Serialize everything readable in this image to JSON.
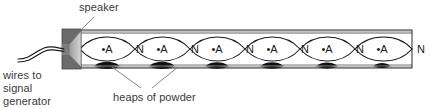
{
  "figure": {
    "background_color": "#ffffff"
  },
  "labels": {
    "speaker": "speaker",
    "wires_line1": "wires to",
    "wires_line2": "signal",
    "wires_line3": "generator",
    "heaps": "heaps of powder"
  },
  "diagram": {
    "tube": {
      "x": 80,
      "y": 30,
      "width": 332,
      "height": 38,
      "outline_color": "#2b2b2b",
      "wall_fill": "#b9b9b9",
      "interior_fill": "#ffffff"
    },
    "speaker": {
      "x": 62,
      "y": 29,
      "width": 19,
      "height": 40,
      "body_color": "#6b6b6b",
      "cone_color": "#c9c9c9",
      "outline_color": "#4a4a4a"
    },
    "wires": {
      "color": "#1a1a1a",
      "stroke": 1.2
    },
    "wave": {
      "color": "#1a1a1a",
      "stroke": 1.1,
      "axis_y": 49,
      "amplitude": 16,
      "loops": 6,
      "start_x": 80,
      "end_x": 412
    },
    "antinode_marker": "•A",
    "node_marker": "N",
    "antinodes": [
      {
        "label": "•A",
        "x": 107
      },
      {
        "label": "•A",
        "x": 162
      },
      {
        "label": "•A",
        "x": 217
      },
      {
        "label": "•A",
        "x": 272
      },
      {
        "label": "•A",
        "x": 327
      },
      {
        "label": "•A",
        "x": 382
      }
    ],
    "nodes": [
      {
        "label": "N",
        "x": 140
      },
      {
        "label": "N",
        "x": 195
      },
      {
        "label": "N",
        "x": 250
      },
      {
        "label": "N",
        "x": 305
      },
      {
        "label": "N",
        "x": 360
      },
      {
        "label": "N",
        "x": 420
      }
    ],
    "powder_heaps": [
      {
        "x": 107,
        "width": 26
      },
      {
        "x": 162,
        "width": 26
      },
      {
        "x": 217,
        "width": 26
      },
      {
        "x": 272,
        "width": 26
      },
      {
        "x": 327,
        "width": 26
      },
      {
        "x": 382,
        "width": 22
      }
    ],
    "leader_lines": [
      {
        "from_x": 92,
        "from_y": 19,
        "to_x": 78,
        "to_y": 34,
        "name": "speaker"
      },
      {
        "from_x": 145,
        "from_y": 88,
        "to_x": 113,
        "to_y": 68,
        "name": "heap-left"
      },
      {
        "from_x": 152,
        "from_y": 88,
        "to_x": 177,
        "to_y": 68,
        "name": "heap-right"
      }
    ]
  },
  "colors": {
    "text": "#3a3a3a",
    "ink": "#1a1a1a",
    "tube_wall": "#b9b9b9",
    "speaker_body": "#6b6b6b",
    "speaker_cone": "#c9c9c9",
    "powder": "#0d0d0d"
  }
}
